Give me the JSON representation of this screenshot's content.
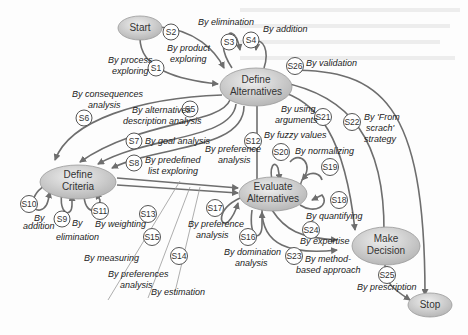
{
  "diagram": {
    "nodes": {
      "start": "Start",
      "define_alternatives_1": "Define",
      "define_alternatives_2": "Alternatives",
      "define_criteria_1": "Define",
      "define_criteria_2": "Criteria",
      "evaluate_alternatives_1": "Evaluate",
      "evaluate_alternatives_2": "Alternatives",
      "make_decision_1": "Make",
      "make_decision_2": "Decision",
      "stop": "Stop"
    },
    "strategies": {
      "s1": "S1",
      "s2": "S2",
      "s3": "S3",
      "s4": "S4",
      "s5": "S5",
      "s6": "S6",
      "s7": "S7",
      "s8": "S8",
      "s9": "S9",
      "s10": "S10",
      "s11": "S11",
      "s12": "S12",
      "s13": "S13",
      "s14": "S14",
      "s15": "S15",
      "s16": "S16",
      "s17": "S17",
      "s18": "S18",
      "s19": "S19",
      "s20": "S20",
      "s21": "S21",
      "s22": "S22",
      "s23": "S23",
      "s24": "S24",
      "s25": "S25",
      "s26": "S26"
    },
    "labels": {
      "s1_a": "By process",
      "s1_b": "exploring",
      "s2_a": "By product",
      "s2_b": "exploring",
      "s3": "By elimination",
      "s4": "By addition",
      "s5_a": "By alternatives",
      "s5_b": "description analysis",
      "s6_a": "By consequences",
      "s6_b": "analysis",
      "s7": "By goal analysis",
      "s8_a": "By predefined",
      "s8_b": "list exploring",
      "s9_a": "By",
      "s9_b": "elimination",
      "s10_a": "By",
      "s10_b": "addition",
      "s11": "By weighting",
      "s12_a": "By preference",
      "s12_b": "analysis",
      "s13": "By measuring",
      "s14": "By estimation",
      "s15_a": "By preferences",
      "s15_b": "analysis",
      "s16_a": "By domination",
      "s16_b": "analysis",
      "s17_a": "By preference",
      "s17_b": "analysis",
      "s18": "By quantifying",
      "s19": "By normalizing",
      "s20": "By fuzzy values",
      "s21_a": "By using",
      "s21_b": "arguments",
      "s22_a": "By 'From",
      "s22_b": "scrach'",
      "s22_c": "strategy",
      "s23_a": "By method-",
      "s23_b": "based approach",
      "s24": "By expertise",
      "s25": "By prescription",
      "s26": "By validation"
    },
    "colors": {
      "node_fill_light": "#e6e6e6",
      "node_fill_dark": "#b5b5b5",
      "edge": "#6e6e6e"
    }
  }
}
